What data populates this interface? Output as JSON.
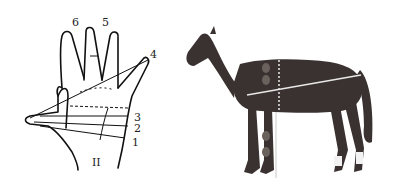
{
  "hand_diagram": {
    "labels": {
      "l1": "1",
      "l2": "2",
      "l3": "3",
      "l4": "4",
      "l5": "5",
      "l6": "6",
      "roman": "II"
    }
  },
  "horse_diagram": {
    "subject": "horse",
    "colors": {
      "coat": "#3a3230",
      "measure_line": "#e8e8e8"
    }
  }
}
